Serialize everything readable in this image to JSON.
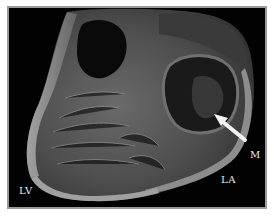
{
  "figure": {
    "labels": {
      "lv": "LV",
      "la": "LA",
      "m": "M"
    },
    "arrow": {
      "color": "#f2f2f2",
      "points_to": "M"
    },
    "colors": {
      "background": "#ffffff",
      "frame": "#9a9a9a",
      "photo_bg": "#020202",
      "tissue_light": "#8a8a8a",
      "tissue_mid": "#5a5a5a",
      "tissue_dark": "#2a2a2a"
    }
  }
}
